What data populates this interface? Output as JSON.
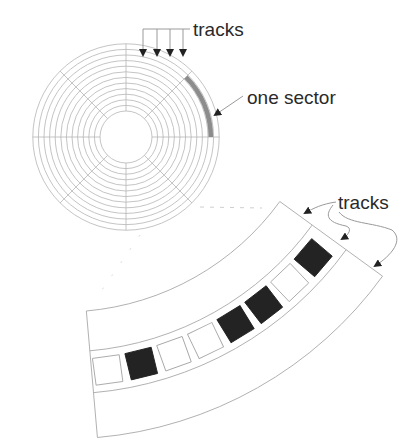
{
  "diagram": {
    "disk": {
      "label_tracks": "tracks",
      "label_sector": "one sector",
      "center": [
        126,
        137
      ],
      "inner_radius": 26,
      "ring_count": 13,
      "ring_spacing": 5.6,
      "spoke_count": 8,
      "sector_color": "#8c8c8c",
      "line_color": "#b5b5b5"
    },
    "track_band": {
      "label_tracks": "tracks",
      "center": [
        63,
        44
      ],
      "radii": [
        268,
        308,
        350,
        395
      ],
      "angle_start_deg": 36,
      "angle_end_deg": 85,
      "sectors": [
        {
          "index": 1,
          "state": "empty"
        },
        {
          "index": 2,
          "state": "filled"
        },
        {
          "index": 3,
          "state": "empty"
        },
        {
          "index": 4,
          "state": "empty"
        },
        {
          "index": 5,
          "state": "filled"
        },
        {
          "index": 6,
          "state": "filled"
        },
        {
          "index": 7,
          "state": "empty"
        },
        {
          "index": 8,
          "state": "filled"
        }
      ],
      "filled_color": "#232323",
      "line_color": "#a8a8a8"
    }
  }
}
